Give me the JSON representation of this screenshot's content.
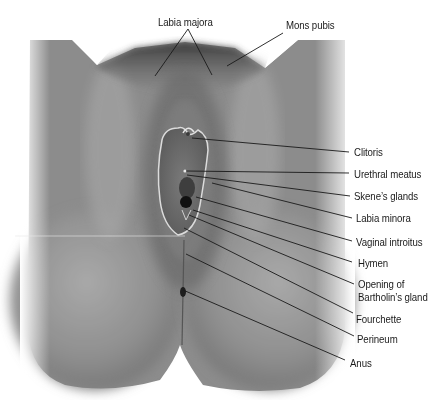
{
  "figure": {
    "style": "grayscale illustration with leader-line labels"
  },
  "labels": {
    "labia_majora": "Labia majora",
    "mons_pubis": "Mons pubis",
    "clitoris": "Clitoris",
    "urethral_meatus": "Urethral meatus",
    "skenes_glands": "Skene’s glands",
    "labia_minora": "Labia minora",
    "vaginal_introitus": "Vaginal introitus",
    "hymen": "Hymen",
    "bartholin_line1": "Opening of",
    "bartholin_line2": "Bartholin’s gland",
    "fourchette": "Fourchette",
    "perineum": "Perineum",
    "anus": "Anus"
  },
  "colors": {
    "background": "#ffffff",
    "line": "#1a1a1a",
    "skin_dark": "#4a4a4a",
    "skin_mid": "#8a8a8a",
    "skin_light": "#b8b8b8"
  }
}
